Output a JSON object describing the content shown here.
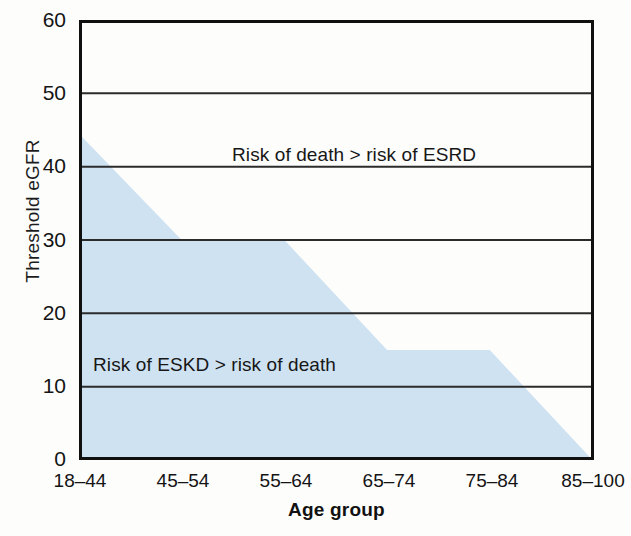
{
  "chart_data": {
    "type": "area",
    "title": "",
    "subtitle": "",
    "xlabel": "Age group",
    "ylabel": "Threshold eGFR",
    "categories": [
      "18–44",
      "45–54",
      "55–64",
      "65–74",
      "75–84",
      "85–100"
    ],
    "series": [
      {
        "name": "Threshold eGFR boundary",
        "values": [
          44.5,
          30,
          30,
          15,
          15,
          0
        ]
      }
    ],
    "ylim": [
      0,
      60
    ],
    "yticks": [
      0,
      10,
      20,
      30,
      40,
      50,
      60
    ],
    "ytick_labels": [
      "0",
      "10",
      "20",
      "30",
      "40",
      "50",
      "60"
    ],
    "xtick_labels": [
      "18–44",
      "45–54",
      "55–64",
      "65–74",
      "75–84",
      "85–100"
    ],
    "grid": true,
    "grid_axis": "y",
    "legend": "none",
    "fill_color": "#cfe2f2",
    "grid_color": "#2a2a2a",
    "axis_color": "#111111",
    "annotations": [
      {
        "id": "upper",
        "text": "Risk of death > risk of ESRD",
        "region": "above-shaded-area"
      },
      {
        "id": "lower",
        "text": "Risk of ESKD > risk of death",
        "region": "inside-shaded-area"
      }
    ]
  }
}
